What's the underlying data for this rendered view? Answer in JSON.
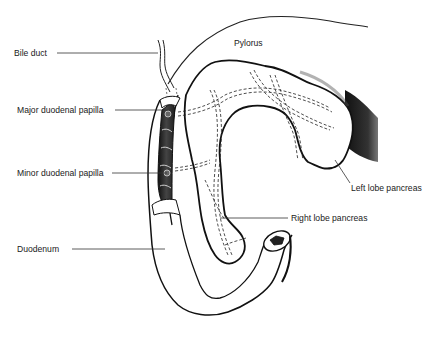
{
  "diagram": {
    "type": "anatomical-line-drawing",
    "labels": [
      {
        "id": "bile-duct",
        "text": "Bile duct"
      },
      {
        "id": "major-duodenal-papilla",
        "text": "Major duodenal papilla"
      },
      {
        "id": "minor-duodenal-papilla",
        "text": "Minor duodenal papilla"
      },
      {
        "id": "duodenum",
        "text": "Duodenum"
      },
      {
        "id": "pylorus",
        "text": "Pylorus"
      },
      {
        "id": "left-lobe-pancreas",
        "text": "Left lobe pancreas"
      },
      {
        "id": "right-lobe-pancreas",
        "text": "Right lobe pancreas"
      }
    ],
    "colors": {
      "background": "#ffffff",
      "ink": "#1a1a1a",
      "shading": "#2a2a2a"
    }
  }
}
